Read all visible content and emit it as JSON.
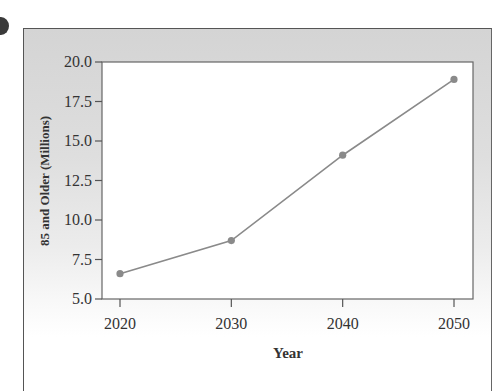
{
  "chart_data": {
    "type": "line",
    "title": "",
    "xlabel": "Year",
    "ylabel": "85 and Older (Millions)",
    "x": [
      2020,
      2030,
      2040,
      2050
    ],
    "categories": [
      "2020",
      "2030",
      "2040",
      "2050"
    ],
    "series": [
      {
        "name": "85 and Older (Millions)",
        "values": [
          6.6,
          8.7,
          14.1,
          18.9
        ]
      }
    ],
    "xlim": [
      2018,
      2052
    ],
    "ylim": [
      5.0,
      20.0
    ],
    "yticks": [
      "5.0",
      "7.5",
      "10.0",
      "12.5",
      "15.0",
      "17.5",
      "20.0"
    ],
    "xticks": [
      "2020",
      "2030",
      "2040",
      "2050"
    ],
    "grid": false,
    "legend": "none",
    "colors": {
      "line": "#8a8a8a",
      "marker": "#8a8a8a",
      "frame_bg": "#d8d8d8",
      "plot_bg": "#ffffff"
    }
  }
}
